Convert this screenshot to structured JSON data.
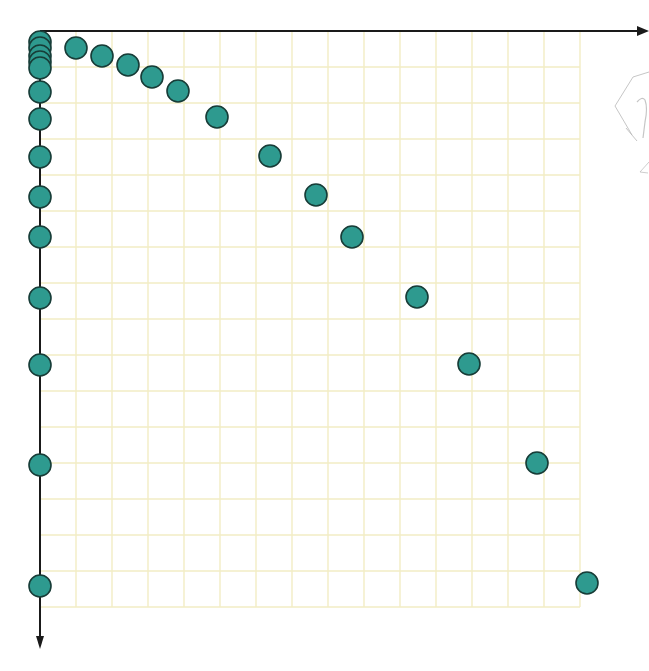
{
  "chart_data": {
    "type": "scatter",
    "title": "",
    "xlabel": "",
    "ylabel": "",
    "grid": true,
    "legend": null,
    "axes": {
      "origin_px": [
        40,
        31
      ],
      "cell_px": 36,
      "x_direction": "right",
      "y_direction": "down",
      "grid_cols": 15,
      "grid_rows": 16,
      "x_arrow_end_px": 649,
      "y_arrow_end_px": 649
    },
    "colors": {
      "point_fill": "#2e9a8f",
      "point_stroke": "#173c37",
      "axis": "#1a1a1a",
      "grid": "#f2edc4",
      "sketch": "#b8b8b8"
    },
    "point_radius_px": 11,
    "series": [
      {
        "name": "curve-points",
        "points_px": [
          [
            76,
            48
          ],
          [
            102,
            56
          ],
          [
            128,
            65
          ],
          [
            152,
            77
          ],
          [
            178,
            91
          ],
          [
            217,
            117
          ],
          [
            270,
            156
          ],
          [
            316,
            195
          ],
          [
            352,
            237
          ],
          [
            417,
            297
          ],
          [
            469,
            364
          ],
          [
            537,
            463
          ],
          [
            587,
            583
          ]
        ],
        "points_grid_units": [
          [
            1.0,
            0.47
          ],
          [
            1.72,
            0.69
          ],
          [
            2.44,
            0.94
          ],
          [
            3.11,
            1.28
          ],
          [
            3.83,
            1.67
          ],
          [
            4.92,
            2.39
          ],
          [
            6.39,
            3.47
          ],
          [
            7.67,
            4.56
          ],
          [
            8.67,
            5.72
          ],
          [
            10.47,
            7.39
          ],
          [
            11.92,
            9.25
          ],
          [
            13.81,
            12.0
          ],
          [
            15.19,
            15.33
          ]
        ]
      },
      {
        "name": "y-axis-projections",
        "points_px": [
          [
            40,
            42
          ],
          [
            40,
            48
          ],
          [
            40,
            56
          ],
          [
            40,
            62
          ],
          [
            40,
            68
          ],
          [
            40,
            92
          ],
          [
            40,
            119
          ],
          [
            40,
            157
          ],
          [
            40,
            197
          ],
          [
            40,
            237
          ],
          [
            40,
            298
          ],
          [
            40,
            365
          ],
          [
            40,
            465
          ],
          [
            40,
            586
          ]
        ],
        "points_grid_units": [
          [
            0,
            0.31
          ],
          [
            0,
            0.47
          ],
          [
            0,
            0.69
          ],
          [
            0,
            0.86
          ],
          [
            0,
            1.03
          ],
          [
            0,
            1.69
          ],
          [
            0,
            2.44
          ],
          [
            0,
            3.5
          ],
          [
            0,
            4.61
          ],
          [
            0,
            5.72
          ],
          [
            0,
            7.42
          ],
          [
            0,
            9.28
          ],
          [
            0,
            12.06
          ],
          [
            0,
            15.42
          ]
        ]
      }
    ],
    "annotations": [
      {
        "type": "faint-pencil-sketch",
        "description": "partial radical-like gray sketch cut off at right edge",
        "approx_px": [
          610,
          80
        ]
      }
    ]
  }
}
